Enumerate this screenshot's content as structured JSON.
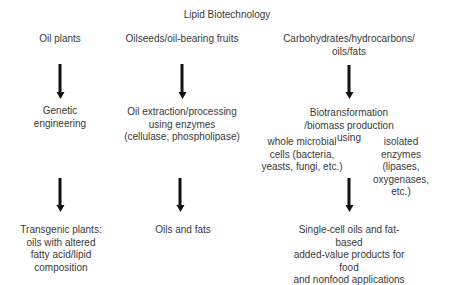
{
  "title": "Lipid Biotechnology",
  "columns": [
    {
      "source": "Oil plants",
      "process": "Genetic\nengineering",
      "result": "Transgenic plants:\noils with altered\nfatty acid/lipid\ncomposition"
    },
    {
      "source": "Oilseeds/oil-bearing fruits",
      "process": "Oil extraction/processing\nusing enzymes\n(cellulase, phospholipase)",
      "result": "Oils and fats"
    },
    {
      "source": "Carbohydrates/hydrocarbons/\noils/fats",
      "process": "Biotransformation /biomass production\nusing",
      "sub_options": [
        "whole microbial\ncells (bacteria,\nyeasts, fungi, etc.)",
        "isolated enzymes\n(lipases, oxygenases,\netc.)"
      ],
      "result": "Single-cell oils and fat-based\nadded-value products for food\nand nonfood applications"
    }
  ],
  "colors": {
    "text": "#3a3a3a",
    "arrow": "#111111"
  }
}
